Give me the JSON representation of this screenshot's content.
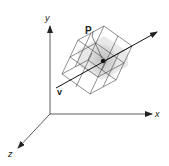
{
  "diagram": {
    "axes": {
      "x_label": "x",
      "y_label": "y",
      "z_label": "z"
    },
    "point_label": {
      "main": "P",
      "subscript": "i"
    },
    "vector_label": "v",
    "colors": {
      "line": "#333333",
      "box_fill": "#e6e6e6",
      "point": "#111111"
    }
  }
}
